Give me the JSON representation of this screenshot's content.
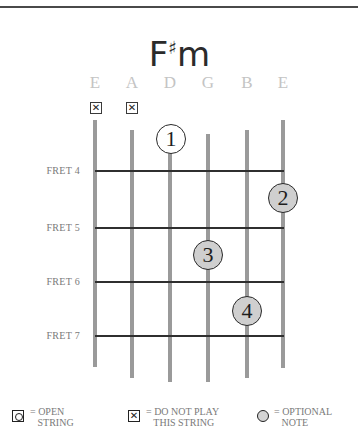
{
  "chord": {
    "name_root": "F",
    "name_accidental": "♯",
    "name_quality": "m"
  },
  "strings": [
    {
      "name": "E",
      "x": 95,
      "top": 120,
      "bottom": 367,
      "muted": true
    },
    {
      "name": "A",
      "x": 132,
      "top": 130,
      "bottom": 378,
      "muted": true
    },
    {
      "name": "D",
      "x": 170,
      "top": 139,
      "bottom": 382,
      "muted": false
    },
    {
      "name": "G",
      "x": 208,
      "top": 134,
      "bottom": 382,
      "muted": false
    },
    {
      "name": "B",
      "x": 247,
      "top": 130,
      "bottom": 378,
      "muted": false
    },
    {
      "name": "E",
      "x": 283,
      "top": 120,
      "bottom": 368,
      "muted": false
    }
  ],
  "mute_symbol": "✕",
  "frets": [
    {
      "label": "FRET 4",
      "y": 171
    },
    {
      "label": "FRET 5",
      "y": 228
    },
    {
      "label": "FRET 6",
      "y": 282
    },
    {
      "label": "FRET 7",
      "y": 336
    }
  ],
  "fingers": [
    {
      "number": "1",
      "string": "D",
      "x": 171,
      "y": 139,
      "style": "open"
    },
    {
      "number": "2",
      "string": "E",
      "x": 283,
      "y": 198,
      "style": "filled"
    },
    {
      "number": "3",
      "string": "G",
      "x": 208,
      "y": 255,
      "style": "filled"
    },
    {
      "number": "4",
      "string": "B",
      "x": 247,
      "y": 311,
      "style": "filled"
    }
  ],
  "legend": {
    "open_string": "= OPEN\n   STRING",
    "do_not_play": "= DO NOT PLAY\n   THIS STRING",
    "optional_note": "= OPTIONAL\n   NOTE",
    "x_symbol": "✕"
  },
  "colors": {
    "string": "#9a9a9a",
    "fret": "#2f2f2f",
    "optional_fill": "#cfcfcf",
    "label_gray": "#7a7a7a",
    "string_name_gray": "#c4c4c4"
  }
}
